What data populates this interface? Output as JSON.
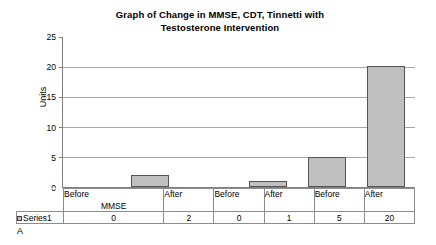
{
  "chart_data": {
    "type": "bar",
    "title": "Graph of Change in MMSE, CDT, Tinnetti with Testosterone Intervention",
    "title_line1": "Graph of Change in MMSE, CDT, Tinnetti with",
    "title_line2": "Testosterone Intervention",
    "xlabel": "",
    "ylabel": "Units",
    "ylim": [
      0,
      25
    ],
    "ytick_labels": [
      "0",
      "5",
      "10",
      "15",
      "20",
      "25"
    ],
    "ytick_values": [
      0,
      5,
      10,
      15,
      20,
      25
    ],
    "grid": true,
    "grid_axis": "y",
    "legend_position": "data-table-row",
    "categories": [
      "Before",
      "After",
      "Before",
      "After",
      "Before",
      "After"
    ],
    "groups": [
      "MMSE",
      "CDT",
      "Tinetti"
    ],
    "group_spans": [
      2,
      2,
      2
    ],
    "series": [
      {
        "name": "Series1",
        "values": [
          0,
          2,
          0,
          1,
          5,
          20
        ],
        "color": "#bfbfbf",
        "border_color": "#555555"
      }
    ],
    "data_table": {
      "row_label": "Series1",
      "values": [
        "0",
        "2",
        "0",
        "1",
        "5",
        "20"
      ]
    }
  },
  "figure": {
    "caption": "A"
  },
  "colors": {
    "bar_fill": "#bfbfbf",
    "bar_border": "#555555",
    "gridline": "#a6a6a6",
    "axis": "#808080",
    "table_border": "#8c8c8c",
    "background": "#ffffff",
    "text": "#000000"
  }
}
